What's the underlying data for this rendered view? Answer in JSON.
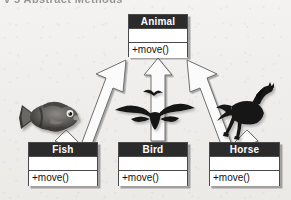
{
  "page": {
    "top_partial_heading": "v 5 Abstract Methods",
    "background_color": "#f1f0ee"
  },
  "diagram": {
    "type": "uml-class-diagram",
    "relationship": "generalization",
    "header_color": "#2b2b2b",
    "box_fill": "#ffffff",
    "border_color": "#4a4a4a",
    "superclass": {
      "name": "Animal",
      "attributes": [],
      "operations": [
        "+move()"
      ]
    },
    "subclasses": [
      {
        "name": "Fish",
        "attributes": [],
        "operations": [
          "+move()"
        ],
        "artwork": "fish-clipart"
      },
      {
        "name": "Bird",
        "attributes": [],
        "operations": [
          "+move()"
        ],
        "artwork": "bird-clipart"
      },
      {
        "name": "Horse",
        "attributes": [],
        "operations": [
          "+move()"
        ],
        "artwork": "horse-clipart"
      }
    ],
    "arrows": [
      {
        "name": "generalization-arrow-fish",
        "from": "Fish",
        "to": "Animal",
        "style": "hollow-block-arrow"
      },
      {
        "name": "generalization-arrow-bird",
        "from": "Bird",
        "to": "Animal",
        "style": "hollow-block-arrow"
      },
      {
        "name": "generalization-arrow-horse",
        "from": "Horse",
        "to": "Animal",
        "style": "hollow-block-arrow"
      }
    ]
  }
}
